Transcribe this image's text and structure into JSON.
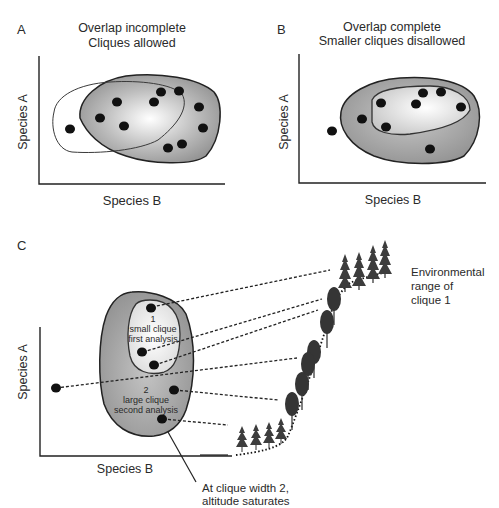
{
  "panels": {
    "a": {
      "letter": "A",
      "title_line1": "Overlap incomplete",
      "title_line2": "Cliques allowed",
      "y_axis": "Species A",
      "x_axis": "Species B"
    },
    "b": {
      "letter": "B",
      "title_line1": "Overlap complete",
      "title_line2": "Smaller cliques disallowed",
      "y_axis": "Species A",
      "x_axis": "Species B"
    },
    "c": {
      "letter": "C",
      "y_axis": "Species A",
      "x_axis": "Species B",
      "clique1_number": "1",
      "clique1_line1": "small clique",
      "clique1_line2": "first analysis",
      "clique2_number": "2",
      "clique2_line1": "large clique",
      "clique2_line2": "second analysis",
      "env_line1": "Environmental",
      "env_line2": "range of",
      "env_line3": "clique 1",
      "note_line1": "At clique width 2,",
      "note_line2": "altitude saturates"
    }
  },
  "colors": {
    "ink": "#1a1a1a",
    "shaded_region": "#9a9a9a",
    "light_region": "#f2f2f2",
    "tree_conifer": "#3a3a3a",
    "tree_deciduous": "#2c2c2c"
  }
}
